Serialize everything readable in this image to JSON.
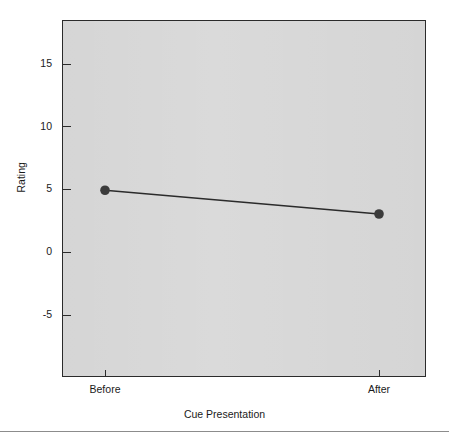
{
  "chart_data": {
    "type": "line",
    "title": "",
    "subtitle": "",
    "xlabel": "Cue Presentation",
    "ylabel": "Rating",
    "categories": [
      "Before",
      "After"
    ],
    "values": [
      4.9,
      3.0
    ],
    "series": [
      {
        "name": "Rating",
        "values": [
          4.9,
          3.0
        ]
      }
    ],
    "x_tick_labels": [
      "Before",
      "After"
    ],
    "y_tick_labels": [
      "15",
      "10",
      "5",
      "0",
      "-5"
    ],
    "y_ticks": [
      15,
      10,
      5,
      0,
      -5
    ],
    "ylim": [
      -7.5,
      18.5
    ],
    "grid": false,
    "legend": "none",
    "marker": "filled-circle",
    "point_color": "#3b3b3b",
    "line_color": "#2b2b2b",
    "panel_background": "#d3d3d3",
    "panel_border_color": "#2b2b2b",
    "text_color": "#1a1a1a"
  },
  "axes": {
    "y": {
      "label": "Rating",
      "ticks": [
        {
          "label": "15",
          "value": 15
        },
        {
          "label": "10",
          "value": 10
        },
        {
          "label": "5",
          "value": 5
        },
        {
          "label": "0",
          "value": 0
        },
        {
          "label": "-5",
          "value": -5
        }
      ]
    },
    "x": {
      "label": "Cue Presentation",
      "ticks": [
        {
          "label": "Before",
          "value": 0
        },
        {
          "label": "After",
          "value": 1
        }
      ]
    }
  },
  "points": [
    {
      "category": "Before",
      "value": 4.9
    },
    {
      "category": "After",
      "value": 3.0
    }
  ]
}
